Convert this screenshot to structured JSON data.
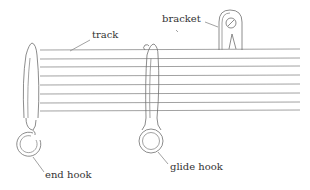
{
  "diagram": {
    "type": "labeled-illustration",
    "labels": {
      "track": "track",
      "bracket": "bracket",
      "end_hook": "end hook",
      "glide_hook": "glide hook"
    },
    "colors": {
      "line": "#8a8a8a",
      "text": "#333333",
      "background": "#ffffff"
    }
  }
}
